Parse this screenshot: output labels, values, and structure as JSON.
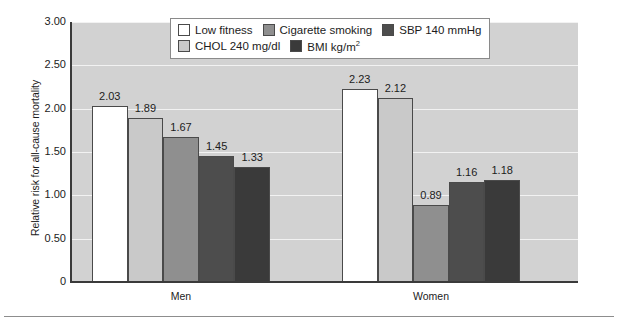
{
  "chart_data": {
    "type": "bar",
    "title": "",
    "xlabel": "",
    "ylabel": "Relative risk for all-cause mortality",
    "categories": [
      "Men",
      "Women"
    ],
    "ylim": [
      0,
      3.0
    ],
    "ytick_labels": [
      "3.00",
      "2.50",
      "2.00",
      "1.50",
      "1.00",
      "0.50",
      "0"
    ],
    "ytick_values": [
      3.0,
      2.5,
      2.0,
      1.5,
      1.0,
      0.5,
      0
    ],
    "grid": true,
    "legend_position": "top-center",
    "series": [
      {
        "name": "Low fitness",
        "color": "#ffffff",
        "values": [
          2.03,
          2.23
        ],
        "labels": [
          "2.03",
          "2.23"
        ]
      },
      {
        "name": "CHOL 240 mg/dl",
        "color": "#c9c9c9",
        "values": [
          1.89,
          2.12
        ],
        "labels": [
          "1.89",
          "2.12"
        ]
      },
      {
        "name": "Cigarette smoking",
        "color": "#8f8f8f",
        "values": [
          1.67,
          0.89
        ],
        "labels": [
          "1.67",
          "0.89"
        ]
      },
      {
        "name": "SBP 140 mmHg",
        "color": "#4d4d4d",
        "values": [
          1.45,
          1.16
        ],
        "labels": [
          "1.45",
          "1.16"
        ]
      },
      {
        "name": "BMI kg/m2",
        "color": "#3a3a3a",
        "values": [
          1.33,
          1.18
        ],
        "labels": [
          "1.33",
          "1.18"
        ]
      }
    ],
    "plot_background": "#d2d2d2",
    "gridline_color": "#f2f2f2"
  },
  "legend": {
    "entries": [
      {
        "label": "Low fitness",
        "color": "#ffffff"
      },
      {
        "label": "Cigarette smoking",
        "color": "#8f8f8f"
      },
      {
        "label": "SBP 140 mmHg",
        "color": "#4d4d4d"
      },
      {
        "label": "CHOL 240 mg/dl",
        "color": "#c9c9c9"
      },
      {
        "label": "BMI kg/m",
        "color": "#3a3a3a",
        "superscript": "2"
      }
    ]
  },
  "axis": {
    "y_title": "Relative risk for all-cause mortality",
    "y_ticks": [
      "3.00",
      "2.50",
      "2.00",
      "1.50",
      "1.00",
      "0.50",
      "0"
    ],
    "x_ticks": [
      "Men",
      "Women"
    ]
  }
}
